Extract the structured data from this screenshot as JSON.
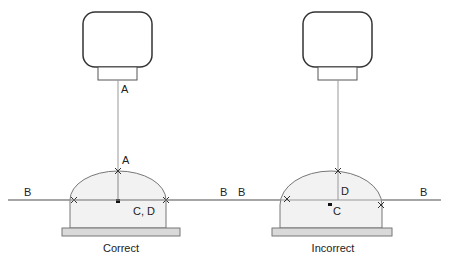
{
  "diagram": {
    "panels": [
      {
        "caption": "Correct",
        "labels": {
          "a_line": "A",
          "a_top": "A",
          "b_left": "B",
          "b_right": "B",
          "center": "C, D"
        }
      },
      {
        "caption": "Incorrect",
        "labels": {
          "b_left": "B",
          "b_right": "B",
          "d": "D",
          "c": "C"
        }
      }
    ],
    "colors": {
      "stroke": "#333333",
      "dome_fill": "#f2f2f2",
      "base_fill": "#d9d9d9",
      "line": "#888888"
    }
  }
}
